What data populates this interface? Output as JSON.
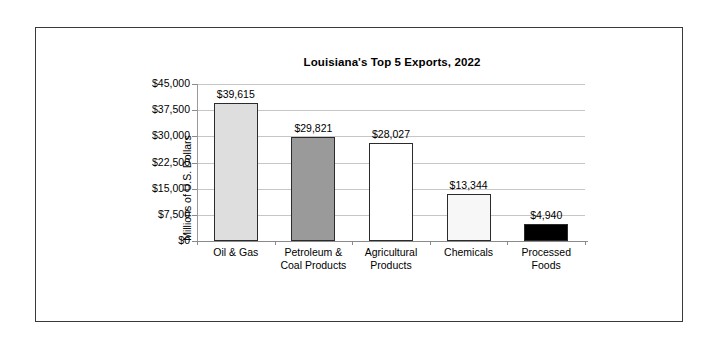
{
  "chart_data": {
    "type": "bar",
    "title": "Louisiana's Top 5 Exports, 2022",
    "xlabel": "",
    "ylabel": "Millions of U.S. Dollars",
    "categories": [
      "Oil & Gas",
      "Petroleum & Coal Products",
      "Agricultural Products",
      "Chemicals",
      "Processed Foods"
    ],
    "category_lines": [
      [
        "Oil & Gas"
      ],
      [
        "Petroleum &",
        "Coal Products"
      ],
      [
        "Agricultural",
        "Products"
      ],
      [
        "Chemicals"
      ],
      [
        "Processed",
        "Foods"
      ]
    ],
    "values": [
      39615,
      29821,
      28027,
      13344,
      4940
    ],
    "value_labels": [
      "$39,615",
      "$29,821",
      "$28,027",
      "$13,344",
      "$4,940"
    ],
    "bar_colors": [
      "#dedede",
      "#9a9a9a",
      "#ffffff",
      "#f7f7f7",
      "#000000"
    ],
    "bar_border_color": "#2b2b2b",
    "ylim": [
      0,
      45000
    ],
    "ytick_values": [
      45000,
      37500,
      30000,
      22500,
      15000,
      7500,
      0
    ],
    "ytick_labels": [
      "$45,000",
      "$37,500",
      "$30,000",
      "$22,500",
      "$15,000",
      "$7,500",
      "$0"
    ],
    "grid": true,
    "gridline_color": "#c6c6c6",
    "legend": null,
    "legend_position": "none",
    "frame_color": "#3a3a3a",
    "background": "#ffffff"
  }
}
